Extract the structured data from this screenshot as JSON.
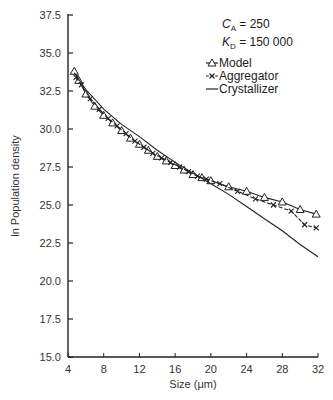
{
  "chart_data": {
    "type": "line",
    "title": "",
    "xlabel": "Size (μm)",
    "ylabel": "ln Population density",
    "xlim": [
      4,
      32
    ],
    "ylim": [
      15.0,
      37.5
    ],
    "xticks": [
      "4",
      "8",
      "12",
      "16",
      "20",
      "24",
      "28",
      "32"
    ],
    "yticks": [
      "15.0",
      "17.5",
      "20.0",
      "22.5",
      "25.0",
      "27.5",
      "30.0",
      "32.5",
      "35.0",
      "37.5"
    ],
    "grid": false,
    "legend_position": "upper right",
    "annotations": [
      {
        "label": "C_A",
        "text": "Cₐ = 250",
        "var": "C",
        "sub": "A",
        "value": "250"
      },
      {
        "label": "K_D",
        "text": "Kᴅ = 150 000",
        "var": "K",
        "sub": "D",
        "value": "150 000"
      }
    ],
    "series": [
      {
        "name": "Model",
        "marker": "triangle",
        "x": [
          4.7,
          5.2,
          6,
          7,
          8,
          9,
          10,
          11,
          12,
          13,
          14,
          15,
          16,
          17,
          18,
          19,
          20,
          22,
          24,
          26,
          28,
          30,
          31.8
        ],
        "y": [
          33.8,
          33.2,
          32.3,
          31.5,
          30.9,
          30.4,
          29.9,
          29.4,
          29.0,
          28.6,
          28.2,
          27.9,
          27.6,
          27.3,
          27.0,
          26.8,
          26.6,
          26.2,
          25.9,
          25.5,
          25.2,
          24.7,
          24.4
        ]
      },
      {
        "name": "Aggregator",
        "marker": "x",
        "x": [
          4.9,
          5.5,
          6.5,
          7.5,
          8.5,
          9.5,
          10.5,
          11.5,
          12.5,
          13.5,
          14.5,
          15.5,
          16.5,
          17.5,
          18.5,
          19.5,
          21,
          23,
          25,
          27,
          29,
          30.5,
          31.8
        ],
        "y": [
          33.4,
          32.9,
          32.0,
          31.3,
          30.7,
          30.2,
          29.7,
          29.2,
          28.8,
          28.4,
          28.1,
          27.8,
          27.5,
          27.2,
          26.9,
          26.7,
          26.4,
          25.9,
          25.4,
          25.0,
          24.6,
          23.7,
          23.5
        ]
      },
      {
        "name": "Crystallizer",
        "marker": "none",
        "x": [
          4.7,
          6,
          8,
          10,
          12,
          14,
          16,
          18,
          20,
          22,
          24,
          26,
          28,
          30,
          32
        ],
        "y": [
          33.7,
          32.6,
          31.3,
          30.3,
          29.5,
          28.6,
          27.8,
          27.1,
          26.4,
          25.7,
          24.9,
          24.1,
          23.3,
          22.4,
          21.6
        ]
      }
    ]
  }
}
